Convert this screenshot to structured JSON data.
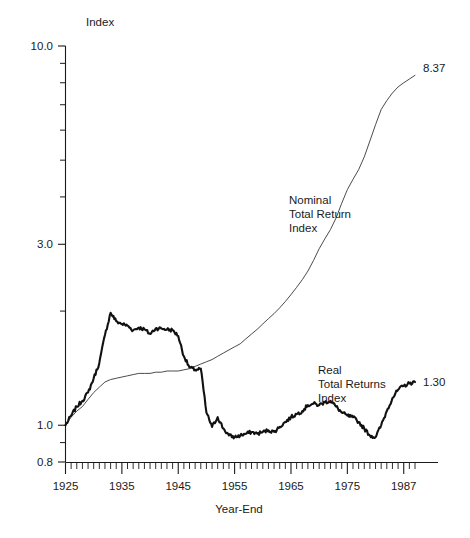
{
  "chart_data": {
    "type": "line",
    "title": "",
    "ylabel": "Index",
    "xlabel": "Year-End",
    "y_scale": "log",
    "ylim": [
      0.8,
      10.0
    ],
    "xlim": [
      1925,
      1987
    ],
    "grid": false,
    "legend_position": "inline-annotations",
    "y_tick_labels": [
      "10.0",
      "3.0",
      "1.0",
      "0.8"
    ],
    "y_tick_values": [
      10.0,
      3.0,
      1.0,
      0.8
    ],
    "y_minor_ticks": [
      9,
      8,
      7,
      6,
      5,
      4,
      2,
      0.9
    ],
    "x_tick_labels": [
      "1925",
      "1935",
      "1945",
      "1955",
      "1965",
      "1975",
      "1987"
    ],
    "x_tick_values": [
      1925,
      1935,
      1945,
      1955,
      1965,
      1975,
      1985
    ],
    "x_minor_tick_step": 1,
    "series": [
      {
        "name": "Nominal Total Return Index",
        "annotation": [
          "Nominal",
          "Total Return",
          "Index"
        ],
        "end_label": "8.37",
        "end_value": 8.37,
        "style": "thin",
        "x": [
          1925,
          1926,
          1927,
          1928,
          1929,
          1930,
          1931,
          1932,
          1933,
          1934,
          1935,
          1936,
          1937,
          1938,
          1939,
          1940,
          1941,
          1942,
          1943,
          1944,
          1945,
          1946,
          1947,
          1948,
          1949,
          1950,
          1951,
          1952,
          1953,
          1954,
          1955,
          1956,
          1957,
          1958,
          1959,
          1960,
          1961,
          1962,
          1963,
          1964,
          1965,
          1966,
          1967,
          1968,
          1969,
          1970,
          1971,
          1972,
          1973,
          1974,
          1975,
          1976,
          1977,
          1978,
          1979,
          1980,
          1981,
          1982,
          1983,
          1984,
          1985,
          1986,
          1987
        ],
        "values": [
          1.0,
          1.05,
          1.09,
          1.12,
          1.17,
          1.22,
          1.26,
          1.3,
          1.32,
          1.33,
          1.34,
          1.35,
          1.36,
          1.37,
          1.37,
          1.37,
          1.38,
          1.38,
          1.39,
          1.39,
          1.39,
          1.4,
          1.41,
          1.43,
          1.45,
          1.47,
          1.49,
          1.52,
          1.55,
          1.58,
          1.61,
          1.64,
          1.69,
          1.74,
          1.79,
          1.85,
          1.91,
          1.97,
          2.04,
          2.12,
          2.21,
          2.31,
          2.42,
          2.55,
          2.72,
          2.92,
          3.1,
          3.28,
          3.52,
          3.85,
          4.18,
          4.45,
          4.72,
          5.1,
          5.62,
          6.2,
          6.8,
          7.18,
          7.52,
          7.8,
          8.0,
          8.18,
          8.37
        ]
      },
      {
        "name": "Real Total Returns Index",
        "annotation": [
          "Real",
          "Total Returns",
          "Index"
        ],
        "end_label": "1.30",
        "end_value": 1.3,
        "style": "thick",
        "x": [
          1925,
          1926,
          1927,
          1928,
          1929,
          1930,
          1931,
          1932,
          1933,
          1934,
          1935,
          1936,
          1937,
          1938,
          1939,
          1940,
          1941,
          1942,
          1943,
          1944,
          1945,
          1946,
          1947,
          1948,
          1949,
          1950,
          1951,
          1952,
          1953,
          1954,
          1955,
          1956,
          1957,
          1958,
          1959,
          1960,
          1961,
          1962,
          1963,
          1964,
          1965,
          1966,
          1967,
          1968,
          1969,
          1970,
          1971,
          1972,
          1973,
          1974,
          1975,
          1976,
          1977,
          1978,
          1979,
          1980,
          1981,
          1982,
          1983,
          1984,
          1985,
          1986,
          1987
        ],
        "values": [
          1.0,
          1.06,
          1.12,
          1.16,
          1.22,
          1.33,
          1.46,
          1.73,
          1.98,
          1.88,
          1.85,
          1.83,
          1.78,
          1.81,
          1.79,
          1.74,
          1.8,
          1.8,
          1.79,
          1.78,
          1.72,
          1.52,
          1.42,
          1.4,
          1.41,
          1.08,
          0.99,
          1.05,
          0.98,
          0.94,
          0.93,
          0.94,
          0.95,
          0.96,
          0.95,
          0.96,
          0.97,
          0.96,
          0.99,
          1.02,
          1.05,
          1.07,
          1.09,
          1.13,
          1.14,
          1.13,
          1.15,
          1.16,
          1.12,
          1.08,
          1.06,
          1.05,
          1.02,
          0.98,
          0.94,
          0.93,
          1.0,
          1.09,
          1.18,
          1.24,
          1.27,
          1.29,
          1.3
        ]
      }
    ]
  },
  "axes": {
    "y_axis_title": "Index",
    "x_axis_title": "Year-End"
  }
}
